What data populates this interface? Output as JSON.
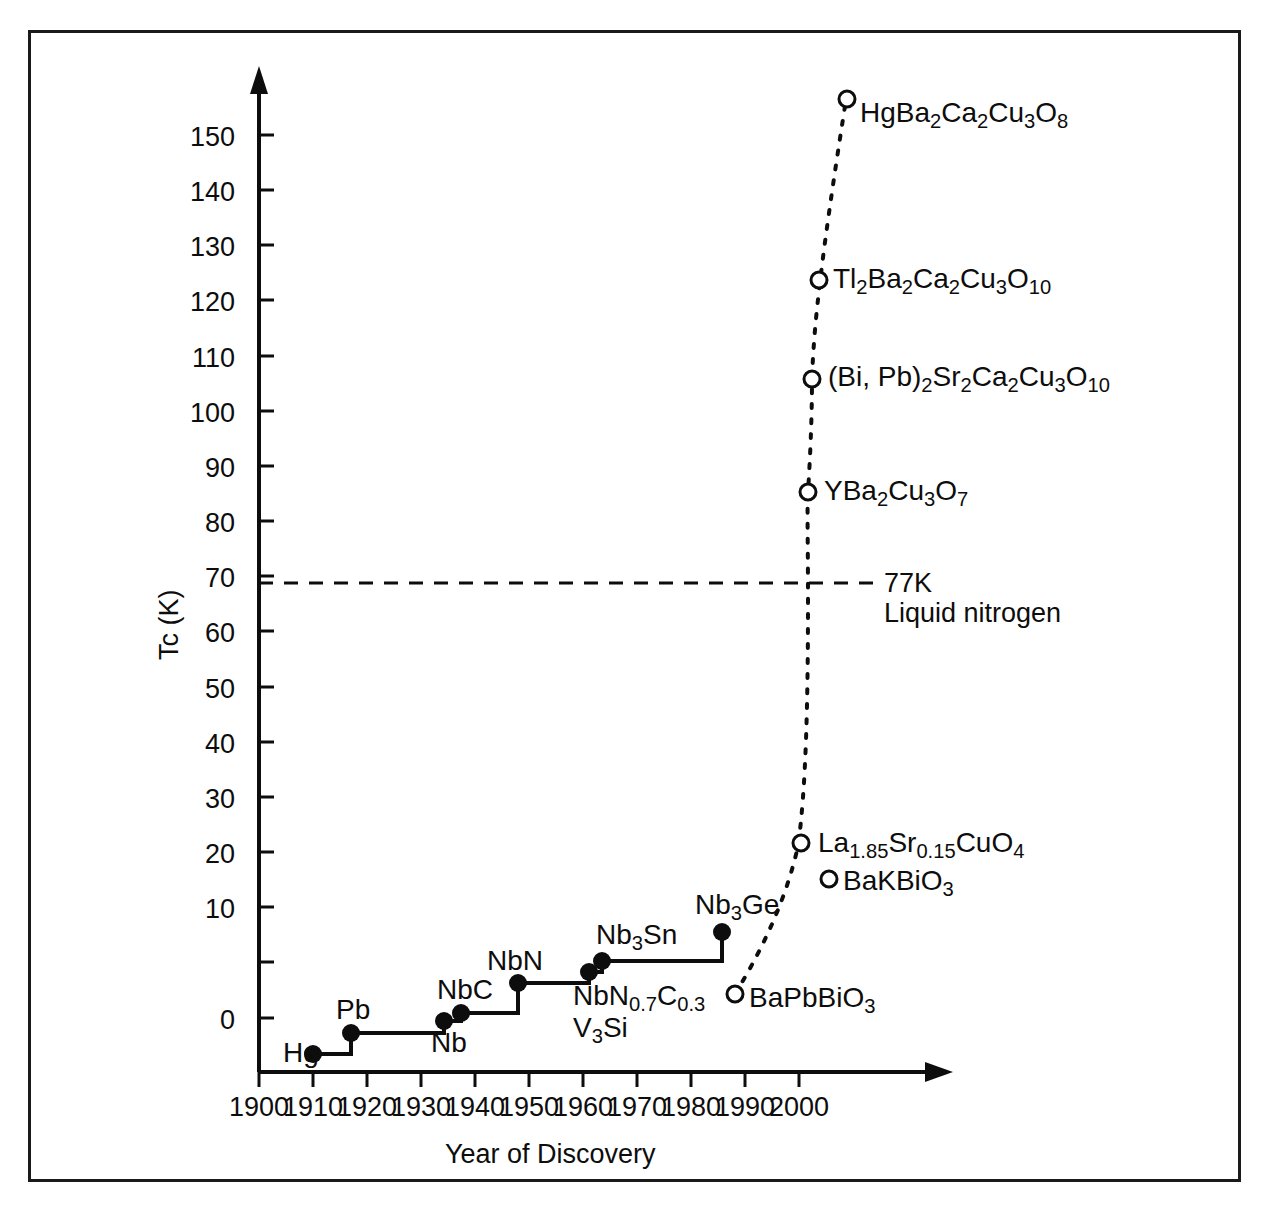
{
  "chart_data": {
    "type": "scatter",
    "title": "",
    "xlabel": "Year of Discovery",
    "ylabel": "Tc (K)",
    "xlim": [
      1896,
      2004
    ],
    "ylim": [
      0,
      155
    ],
    "grid": false,
    "legend": null,
    "x_ticks": [
      "1900",
      "1910",
      "1920",
      "1930",
      "1940",
      "1950",
      "1960",
      "1970",
      "1980",
      "1990",
      "2000"
    ],
    "y_ticks": [
      "0",
      "10",
      "20",
      "30",
      "40",
      "50",
      "60",
      "70",
      "80",
      "90",
      "100",
      "110",
      "120",
      "130",
      "140",
      "150"
    ],
    "annotations": [
      {
        "name": "liquid-nitrogen-line",
        "value": 77,
        "line1": "77K",
        "line2": "Liquid nitrogen",
        "style": "dashed"
      }
    ],
    "series": [
      {
        "name": "Conventional superconductors",
        "marker": "filled-circle",
        "line": "solid-step",
        "points": [
          {
            "label": "Hg",
            "label_html": "Hg",
            "year": 1911,
            "tc": 4.2
          },
          {
            "label": "Pb",
            "label_html": "Pb",
            "year": 1913,
            "tc": 7.2
          },
          {
            "label": "Nb",
            "label_html": "Nb",
            "year": 1930,
            "tc": 9.3
          },
          {
            "label": "NbC",
            "label_html": "NbC",
            "year": 1932,
            "tc": 11
          },
          {
            "label": "NbN",
            "label_html": "NbN",
            "year": 1941,
            "tc": 15.5
          },
          {
            "label": "NbN0.7C0.3",
            "label_html": "NbN<sub>0.7</sub>C<sub>0.3</sub>",
            "year": 1952,
            "tc": 17.5
          },
          {
            "label": "V3Si",
            "label_html": "V<sub>3</sub>Si",
            "year": 1952,
            "tc": 17.5
          },
          {
            "label": "Nb3Sn",
            "label_html": "Nb<sub>3</sub>Sn",
            "year": 1954,
            "tc": 18.9
          },
          {
            "label": "Nb3Ge",
            "label_html": "Nb<sub>3</sub>Ge",
            "year": 1973,
            "tc": 23.2
          }
        ]
      },
      {
        "name": "Oxide / high-Tc superconductors",
        "marker": "open-circle",
        "line": "dotted",
        "points": [
          {
            "label": "BaPbBiO3",
            "label_html": "BaPbBiO<sub>3</sub>",
            "year": 1975,
            "tc": 13
          },
          {
            "label": "La1.85Sr0.15CuO4",
            "label_html": "La<sub>1.85</sub>Sr<sub>0.15</sub>CuO<sub>4</sub>",
            "year": 1986,
            "tc": 37
          },
          {
            "label": "BaKBiO3",
            "label_html": "BaKBiO<sub>3</sub>",
            "year": 1988,
            "tc": 31
          },
          {
            "label": "YBa2Cu3O7",
            "label_html": "YBa<sub>2</sub>Cu<sub>3</sub>O<sub>7</sub>",
            "year": 1987,
            "tc": 92
          },
          {
            "label": "(Bi, Pb)2Sr2Ca2Cu3O10",
            "label_html": "(Bi, Pb)<sub>2</sub>Sr<sub>2</sub>Ca<sub>2</sub>Cu<sub>3</sub>O<sub>10</sub>",
            "year": 1988,
            "tc": 110
          },
          {
            "label": "Tl2Ba2Ca2Cu3O10",
            "label_html": "Tl<sub>2</sub>Ba<sub>2</sub>Ca<sub>2</sub>Cu<sub>3</sub>O<sub>10</sub>",
            "year": 1988,
            "tc": 125
          },
          {
            "label": "HgBa2Ca2Cu3O8",
            "label_html": "HgBa<sub>2</sub>Ca<sub>2</sub>Cu<sub>3</sub>O<sub>8</sub>",
            "year": 1993,
            "tc": 153
          }
        ]
      }
    ]
  },
  "colors": {
    "ink": "#0d0d0d",
    "frame": "#1a1a1a",
    "background": "#ffffff"
  }
}
